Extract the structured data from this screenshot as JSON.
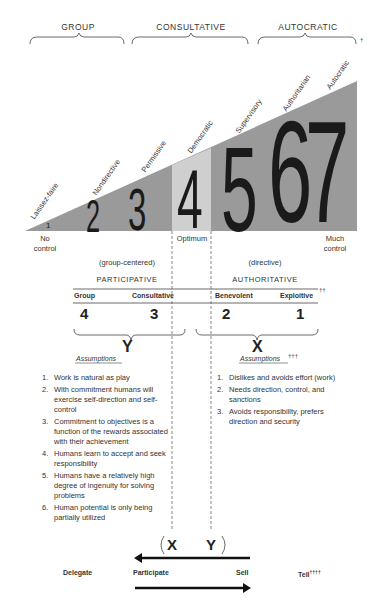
{
  "top_groups": [
    {
      "label": "GROUP"
    },
    {
      "label": "CONSULTATIVE"
    },
    {
      "label": "AUTOCRATIC",
      "mark": "†"
    }
  ],
  "styles": [
    {
      "num": "1",
      "label": "Laissez-faire"
    },
    {
      "num": "2",
      "label": "Nondirective"
    },
    {
      "num": "3",
      "label": "Permissive"
    },
    {
      "num": "4",
      "label": "Democratic"
    },
    {
      "num": "5",
      "label": "Supervisory"
    },
    {
      "num": "6",
      "label": "Authoritarian"
    },
    {
      "num": "7",
      "label": "Autocratic"
    }
  ],
  "scale": {
    "left_line1": "No",
    "left_line2": "control",
    "middle": "Optimum",
    "right_line1": "Much",
    "right_line2": "control"
  },
  "orientation": {
    "left_sub": "(group-centered)",
    "left_title": "PARTICIPATIVE",
    "right_sub": "(directive)",
    "right_title": "AUTHORITATIVE"
  },
  "systems": {
    "headers": [
      "Group",
      "Consultative",
      "Benevolent",
      "Exploitive"
    ],
    "header_mark": "††",
    "numbers": [
      "4",
      "3",
      "2",
      "1"
    ]
  },
  "theory_y": {
    "letter": "Y",
    "title": "Assumptions",
    "items": [
      {
        "n": "1.",
        "text": "Work is natural as play"
      },
      {
        "n": "2.",
        "text": "With commitment humans will exercise self-direction and self-control"
      },
      {
        "n": "3.",
        "text": "Commitment to objectives is a function of the rewards associated with their achievement"
      },
      {
        "n": "4.",
        "text": "Humans learn to accept and seek responsibility"
      },
      {
        "n": "5.",
        "text": "Humans have a relatively high degree of ingenuity for solving problems"
      },
      {
        "n": "6.",
        "text": "Human potential is only being partially utilized"
      }
    ]
  },
  "theory_x": {
    "letter": "X",
    "title": "Assumptions",
    "mark": "†††",
    "items": [
      {
        "n": "1.",
        "text": "Dislikes and avoids effort (work)"
      },
      {
        "n": "2.",
        "text": "Needs direction, control, and sanctions"
      },
      {
        "n": "3.",
        "text": "Avoids responsibility, prefers direction and security"
      }
    ]
  },
  "bottom": {
    "x_label": "X",
    "y_label": "Y",
    "actions": [
      "Delegate",
      "Participate",
      "Sell",
      "Tell"
    ],
    "tell_mark": "††††"
  },
  "colors": {
    "triangle": "#9a9a9a",
    "optimum_band": "#cfcfcf",
    "ink": "#222222"
  }
}
